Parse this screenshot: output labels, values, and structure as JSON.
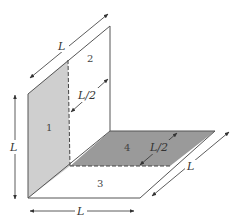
{
  "diagram": {
    "type": "3d-panel-geometry",
    "colors": {
      "background": "#ffffff",
      "panel1_fill": "#cfcfcf",
      "panel4_fill": "#9a9a9a",
      "line": "#555555"
    },
    "panels": [
      {
        "id": "1",
        "label": "1",
        "description": "left vertical panel (shaded light gray)"
      },
      {
        "id": "2",
        "label": "2",
        "description": "back vertical panel"
      },
      {
        "id": "3",
        "label": "3",
        "description": "front floor panel"
      },
      {
        "id": "4",
        "label": "4",
        "description": "back floor panel (shaded dark gray)"
      }
    ],
    "dimensions": {
      "top_depth": "L",
      "panel2_half": "L/2",
      "panel4_half": "L/2",
      "right_depth": "L",
      "left_height": "L",
      "bottom_width": "L"
    }
  }
}
